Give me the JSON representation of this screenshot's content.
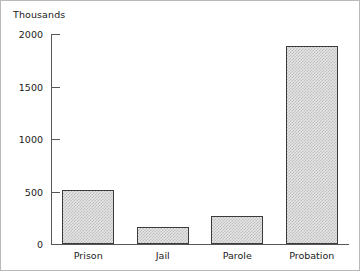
{
  "chart_data": {
    "type": "bar",
    "title": "",
    "subtitle": "",
    "units_label": "Thousands",
    "xlabel": "",
    "ylabel": "",
    "categories": [
      "Prison",
      "Jail",
      "Parole",
      "Probation"
    ],
    "values": [
      510,
      165,
      265,
      1890
    ],
    "series": [
      {
        "name": "Correctional population",
        "values": [
          510,
          165,
          265,
          1890
        ]
      }
    ],
    "ylim": [
      0,
      2000
    ],
    "ytick_values": [
      0,
      500,
      1000,
      1500,
      2000
    ],
    "ytick_labels": [
      "0",
      "500",
      "1000",
      "1500",
      "2000"
    ],
    "grid": false,
    "legend": null,
    "legend_position": "none",
    "annotations": [],
    "colors": {
      "bar_fill": "#e6e6e6",
      "bar_pattern": "#bdbdbd",
      "bar_border": "#3b3b3b",
      "axis": "#575757",
      "text": "#1a1a1a",
      "figure_border": "#b9b9b9",
      "background": "#ffffff"
    }
  }
}
